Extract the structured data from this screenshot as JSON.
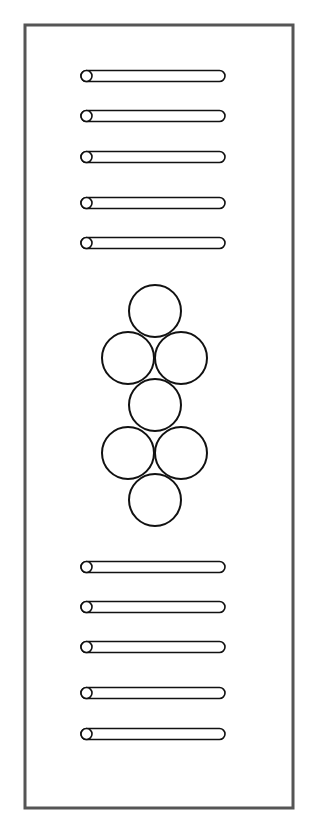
{
  "diagram": {
    "colors": {
      "background": "#ffffff",
      "frame": "#555555",
      "stroke": "#111111"
    },
    "frame": {
      "x": 25,
      "y": 25,
      "width": 268,
      "height": 783
    },
    "rods_top": [
      {
        "y": 76
      },
      {
        "y": 116
      },
      {
        "y": 157
      },
      {
        "y": 203
      },
      {
        "y": 243
      }
    ],
    "rods_bottom": [
      {
        "y": 567
      },
      {
        "y": 607
      },
      {
        "y": 647
      },
      {
        "y": 693
      },
      {
        "y": 734
      }
    ],
    "rod_geometry": {
      "x_start": 81,
      "x_end": 225,
      "height": 11
    },
    "circles": [
      {
        "cx": 155,
        "cy": 311,
        "r": 26
      },
      {
        "cx": 128,
        "cy": 358,
        "r": 26
      },
      {
        "cx": 181,
        "cy": 358,
        "r": 26
      },
      {
        "cx": 155,
        "cy": 405,
        "r": 26
      },
      {
        "cx": 128,
        "cy": 453,
        "r": 26
      },
      {
        "cx": 181,
        "cy": 453,
        "r": 26
      },
      {
        "cx": 155,
        "cy": 500,
        "r": 26
      }
    ]
  }
}
